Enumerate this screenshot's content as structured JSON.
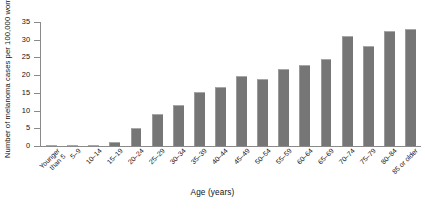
{
  "chart_data": {
    "type": "bar",
    "title": "",
    "xlabel": "Age (years)",
    "ylabel": "Number of melanoma cases per 100,000 women",
    "ylim": [
      0,
      35
    ],
    "yticks": [
      0,
      5,
      10,
      15,
      20,
      25,
      30,
      35
    ],
    "grid": false,
    "legend": "none",
    "bar_color": "#767676",
    "axis_color": "#8a8a8a",
    "categories": [
      "Younger\nthan 5",
      "5–9",
      "10–14",
      "15–19",
      "20–24",
      "25–29",
      "30–34",
      "35–39",
      "40–44",
      "45–49",
      "50–54",
      "55–59",
      "60–64",
      "65–69",
      "70–74",
      "75–79",
      "80–84",
      "85 or older"
    ],
    "values": [
      0.2,
      0.2,
      0.4,
      1.2,
      5.2,
      9.0,
      11.7,
      15.2,
      16.6,
      19.8,
      19.0,
      21.6,
      22.8,
      24.5,
      31.0,
      28.3,
      32.4,
      33.0
    ]
  }
}
